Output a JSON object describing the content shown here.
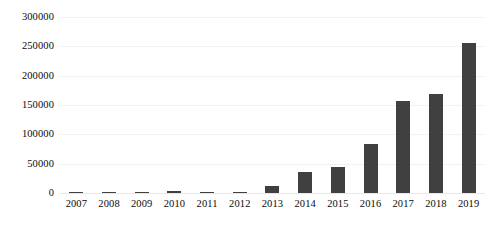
{
  "chart_data": {
    "type": "bar",
    "title": "",
    "subtitle": "",
    "xlabel": "",
    "ylabel": "",
    "categories": [
      "2007",
      "2008",
      "2009",
      "2010",
      "2011",
      "2012",
      "2013",
      "2014",
      "2015",
      "2016",
      "2017",
      "2018",
      "2019"
    ],
    "values": [
      400,
      300,
      600,
      3000,
      800,
      2500,
      12000,
      36000,
      44000,
      84000,
      157000,
      168000,
      256000
    ],
    "series": [
      {
        "name": "",
        "values": [
          400,
          300,
          600,
          3000,
          800,
          2500,
          12000,
          36000,
          44000,
          84000,
          157000,
          168000,
          256000
        ]
      }
    ],
    "ylim": [
      0,
      300000
    ],
    "y_ticks": [
      0,
      50000,
      100000,
      150000,
      200000,
      250000,
      300000
    ],
    "y_tick_labels": [
      "0",
      "50000",
      "100000",
      "150000",
      "200000",
      "250000",
      "300000"
    ],
    "grid": true,
    "legend": false,
    "legend_position": "none",
    "bar_color": "#404040",
    "gridline_color": "#f2f2f2",
    "background_color": "#ffffff",
    "axis_text_color": "#0b0b0b"
  }
}
